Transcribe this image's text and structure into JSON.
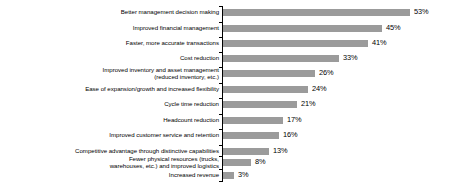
{
  "chart_data": {
    "type": "bar",
    "orientation": "horizontal",
    "title": "",
    "subtitle": "",
    "xlabel": "",
    "ylabel": "",
    "grid": false,
    "legend": null,
    "xlim": [
      0,
      53
    ],
    "value_suffix": "%",
    "bar_color": "#9b9b9b",
    "axis_color": "#000000",
    "text_color": "#000000",
    "categories": [
      "Better management decision making",
      "Improved financial management",
      "Faster, more accurate transactions",
      "Cost reduction",
      "Improved inventory and asset management\n(reduced inventory, etc.)",
      "Ease of expansion/growth and increased flexibility",
      "Cycle time reduction",
      "Headcount reduction",
      "Improved customer service and retention",
      "Competitive advantage through distinctive capabilities",
      "Fewer physical resources (trucks,\nwarehouses, etc.) and improved logistics",
      "Increased revenue"
    ],
    "values": [
      53,
      45,
      41,
      33,
      26,
      24,
      21,
      17,
      16,
      13,
      8,
      3
    ],
    "value_labels": [
      "53%",
      "45%",
      "41%",
      "33%",
      "26%",
      "24%",
      "21%",
      "17%",
      "16%",
      "13%",
      "8%",
      "3%"
    ]
  }
}
